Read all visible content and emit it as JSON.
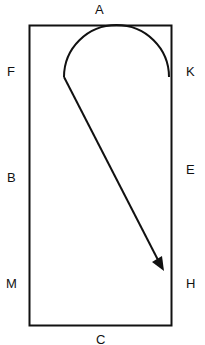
{
  "diagram": {
    "labels": {
      "top": "A",
      "left_upper": "F",
      "right_upper": "K",
      "left_middle": "B",
      "right_middle": "E",
      "left_lower": "M",
      "right_lower": "H",
      "bottom": "C"
    },
    "colors": {
      "stroke": "#111111",
      "background": "#ffffff"
    }
  }
}
